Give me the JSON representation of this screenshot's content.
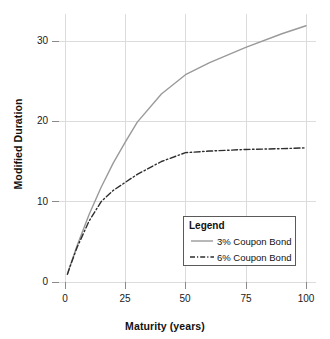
{
  "chart_data": {
    "type": "line",
    "title": "",
    "xlabel": "Maturity (years)",
    "ylabel": "Modified Duration",
    "xlim": [
      0,
      104
    ],
    "ylim": [
      0,
      33
    ],
    "xticks": [
      0,
      25,
      50,
      75,
      100
    ],
    "xtick_labels": [
      "0",
      "25",
      "50",
      "75",
      "100"
    ],
    "yticks": [
      0,
      10,
      20,
      30
    ],
    "ytick_labels": [
      "0",
      "10",
      "20",
      "30"
    ],
    "grid": true,
    "legend_position": "inside lower-right",
    "legend_title": "Legend",
    "series": [
      {
        "name": "3% Coupon Bond",
        "style": "solid",
        "color": "#9a9a9a",
        "x": [
          1,
          2,
          5,
          10,
          15,
          20,
          25,
          30,
          40,
          50,
          60,
          75,
          90,
          100
        ],
        "values": [
          1.0,
          1.9,
          4.5,
          8.4,
          11.8,
          14.8,
          17.4,
          19.9,
          23.4,
          25.8,
          27.3,
          29.2,
          30.9,
          31.9
        ]
      },
      {
        "name": "6% Coupon Bond",
        "style": "dash-dot",
        "color": "#2e2e2e",
        "x": [
          1,
          2,
          5,
          10,
          15,
          20,
          25,
          30,
          40,
          50,
          60,
          75,
          90,
          100
        ],
        "values": [
          0.95,
          1.85,
          4.3,
          7.6,
          10.0,
          11.4,
          12.4,
          13.4,
          15.0,
          16.1,
          16.3,
          16.5,
          16.6,
          16.7
        ]
      }
    ]
  },
  "axes": {
    "x_title": "Maturity (years)",
    "y_title": "Modified Duration",
    "x_tick_labels": [
      "0",
      "25",
      "50",
      "75",
      "100"
    ],
    "y_tick_labels": [
      "0",
      "10",
      "20",
      "30"
    ]
  },
  "legend": {
    "title": "Legend",
    "entries": [
      {
        "label": "3% Coupon Bond",
        "style": "solid",
        "color": "#9a9a9a"
      },
      {
        "label": "6% Coupon Bond",
        "style": "dash-dot",
        "color": "#2e2e2e"
      }
    ]
  },
  "colors": {
    "grid": "#dcdcdc",
    "axis_tick": "#8a8a8a",
    "series_3pct": "#9a9a9a",
    "series_6pct": "#2e2e2e",
    "legend_border": "#5a5a5a",
    "background": "#ffffff"
  }
}
